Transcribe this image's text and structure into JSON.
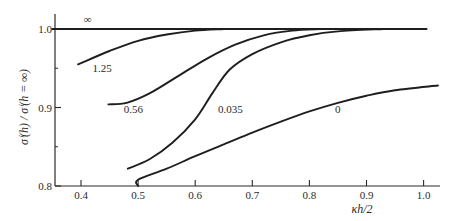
{
  "chart_data": {
    "type": "line",
    "title": "",
    "xlabel": "κh/2",
    "ylabel": "σⁱ(h) / σⁱ(h = ∞)",
    "xlim": [
      0.35,
      1.03
    ],
    "ylim": [
      0.8,
      1.02
    ],
    "grid": false,
    "legend": "inline curve labels",
    "x_ticks": [
      "0.4",
      "0.5",
      "0.6",
      "0.7",
      "0.8",
      "0.9",
      "1.0"
    ],
    "y_ticks": [
      "0.8",
      "0.9",
      "1.0"
    ],
    "series": [
      {
        "name": "∞",
        "points": [
          [
            0.35,
            1.0
          ],
          [
            1.005,
            1.0
          ]
        ]
      },
      {
        "name": "1.25",
        "points": [
          [
            0.395,
            0.955
          ],
          [
            0.45,
            0.972
          ],
          [
            0.5,
            0.985
          ],
          [
            0.55,
            0.993
          ],
          [
            0.6,
            0.998
          ],
          [
            0.65,
            1.0
          ]
        ]
      },
      {
        "name": "0.56",
        "points": [
          [
            0.448,
            0.904
          ],
          [
            0.48,
            0.906
          ],
          [
            0.52,
            0.918
          ],
          [
            0.57,
            0.94
          ],
          [
            0.62,
            0.962
          ],
          [
            0.67,
            0.98
          ],
          [
            0.72,
            0.992
          ],
          [
            0.77,
            0.998
          ],
          [
            0.82,
            1.0
          ]
        ]
      },
      {
        "name": "0.035",
        "points": [
          [
            0.482,
            0.822
          ],
          [
            0.52,
            0.834
          ],
          [
            0.56,
            0.855
          ],
          [
            0.6,
            0.885
          ],
          [
            0.63,
            0.918
          ],
          [
            0.66,
            0.948
          ],
          [
            0.7,
            0.968
          ],
          [
            0.75,
            0.983
          ],
          [
            0.8,
            0.992
          ],
          [
            0.85,
            0.997
          ],
          [
            0.93,
            1.0
          ]
        ]
      },
      {
        "name": "0",
        "points": [
          [
            0.5,
            0.8
          ],
          [
            0.5,
            0.808
          ],
          [
            0.55,
            0.822
          ],
          [
            0.6,
            0.838
          ],
          [
            0.65,
            0.853
          ],
          [
            0.7,
            0.868
          ],
          [
            0.75,
            0.882
          ],
          [
            0.8,
            0.895
          ],
          [
            0.85,
            0.906
          ],
          [
            0.9,
            0.915
          ],
          [
            0.95,
            0.922
          ],
          [
            1.025,
            0.928
          ]
        ]
      }
    ],
    "curve_labels": [
      {
        "text": "∞",
        "x": 0.405,
        "y": 1.008
      },
      {
        "text": "1.25",
        "x": 0.42,
        "y": 0.945
      },
      {
        "text": "0.56",
        "x": 0.475,
        "y": 0.893
      },
      {
        "text": "0.035",
        "x": 0.64,
        "y": 0.893
      },
      {
        "text": "0",
        "x": 0.845,
        "y": 0.893
      }
    ]
  }
}
